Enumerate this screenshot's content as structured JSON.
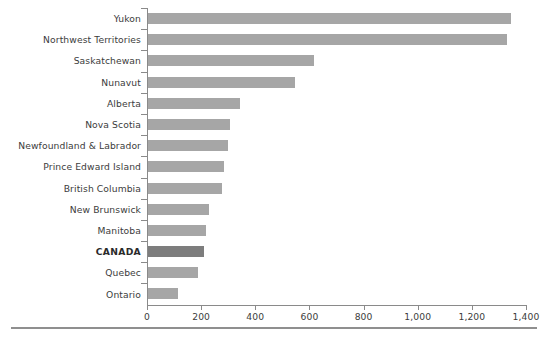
{
  "chart_data": {
    "type": "bar",
    "orientation": "horizontal",
    "title": "",
    "subtitle": "",
    "xlabel": "",
    "ylabel": "",
    "xlim": [
      0,
      1400
    ],
    "xticks": [
      0,
      200,
      400,
      600,
      800,
      1000,
      1200,
      1400
    ],
    "xtick_labels": [
      "0",
      "200",
      "400",
      "600",
      "800",
      "1,000",
      "1,200",
      "1,400"
    ],
    "grid": false,
    "legend": false,
    "highlight_category": "CANADA",
    "colors": {
      "bar": "#a6a6a6",
      "bar_highlight": "#7d7d7d",
      "axis": "#8a8a8a",
      "text": "#3c3c3c",
      "rule": "#8f8f8f",
      "background": "#ffffff"
    },
    "categories": [
      "Yukon",
      "Northwest Territories",
      "Saskatchewan",
      "Nunavut",
      "Alberta",
      "Nova Scotia",
      "Newfoundland & Labrador",
      "Prince Edward Island",
      "British Columbia",
      "New Brunswick",
      "Manitoba",
      "CANADA",
      "Quebec",
      "Ontario"
    ],
    "values": [
      1341,
      1326,
      613,
      543,
      340,
      303,
      295,
      281,
      273,
      226,
      214,
      208,
      185,
      112
    ]
  }
}
